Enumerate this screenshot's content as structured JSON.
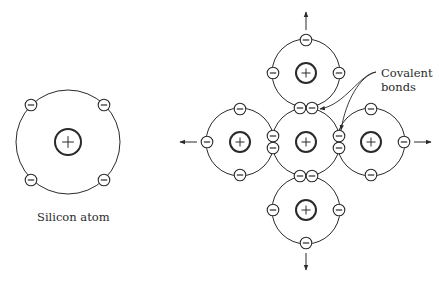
{
  "diagram": {
    "labels": {
      "single_atom": "Silicon atom",
      "covalent_line1": "Covalent",
      "covalent_line2": "bonds"
    },
    "symbols": {
      "nucleus": "+",
      "electron": "−"
    },
    "colors": {
      "stroke": "#2a2a2a",
      "background": "#ffffff"
    },
    "single_atom": {
      "center": [
        68,
        142
      ],
      "orbit_radius": 52,
      "nucleus_radius": 13,
      "electrons": [
        [
          31,
          105
        ],
        [
          104,
          105
        ],
        [
          31,
          180
        ],
        [
          104,
          180
        ]
      ]
    },
    "lattice": {
      "orbit_radius": 34,
      "nucleus_radius": 10,
      "atoms": [
        {
          "name": "center",
          "center": [
            306,
            142
          ]
        },
        {
          "name": "top",
          "center": [
            306,
            73
          ]
        },
        {
          "name": "left",
          "center": [
            240,
            142
          ]
        },
        {
          "name": "right",
          "center": [
            371,
            142
          ]
        },
        {
          "name": "bottom",
          "center": [
            306,
            210
          ]
        }
      ],
      "electrons": [
        [
          306,
          40
        ],
        [
          273,
          73
        ],
        [
          339,
          73
        ],
        [
          300,
          108
        ],
        [
          312,
          108
        ],
        [
          240,
          109
        ],
        [
          207,
          142
        ],
        [
          240,
          175
        ],
        [
          273,
          136
        ],
        [
          273,
          148
        ],
        [
          371,
          109
        ],
        [
          404,
          142
        ],
        [
          371,
          175
        ],
        [
          339,
          136
        ],
        [
          339,
          148
        ],
        [
          300,
          176
        ],
        [
          312,
          176
        ],
        [
          273,
          210
        ],
        [
          339,
          210
        ],
        [
          306,
          243
        ]
      ],
      "arrows": [
        {
          "name": "up",
          "from": [
            306,
            30
          ],
          "to": [
            306,
            12
          ]
        },
        {
          "name": "left",
          "from": [
            197,
            142
          ],
          "to": [
            180,
            142
          ]
        },
        {
          "name": "right",
          "from": [
            414,
            142
          ],
          "to": [
            431,
            142
          ]
        },
        {
          "name": "down",
          "from": [
            306,
            253
          ],
          "to": [
            306,
            270
          ]
        }
      ],
      "bond_pointers": [
        {
          "from": [
            376,
            72
          ],
          "to": [
            320,
            109
          ]
        },
        {
          "from": [
            376,
            72
          ],
          "to": [
            341,
            130
          ]
        }
      ]
    }
  }
}
